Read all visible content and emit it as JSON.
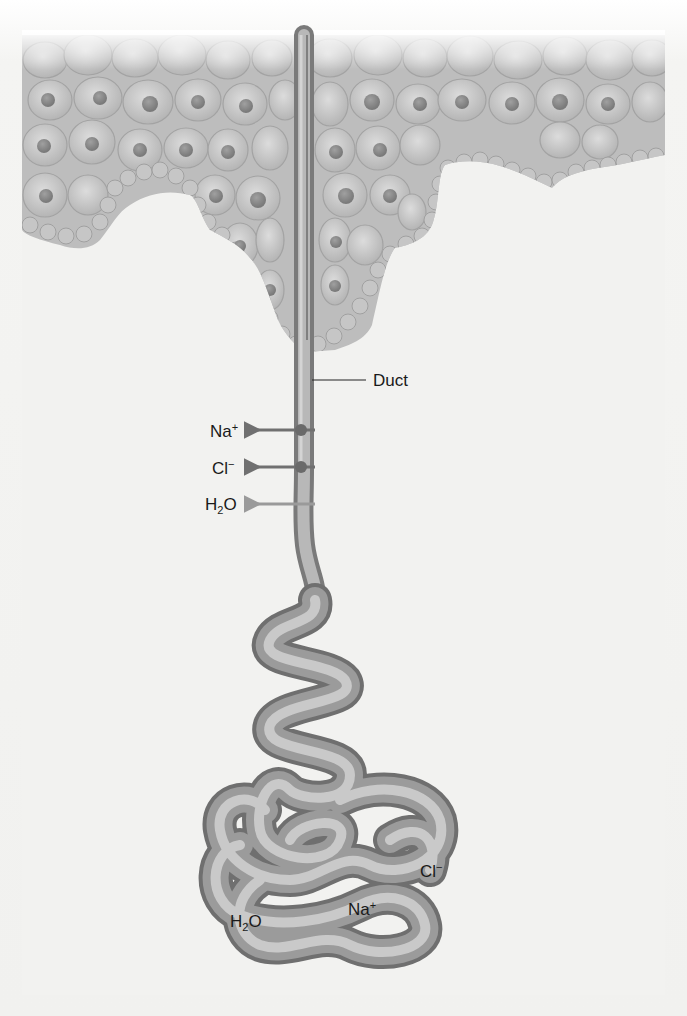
{
  "figure": {
    "background": "#f6f6f4",
    "epidermis_color": "#c9c9c9",
    "tube_color": "#9a9a9a",
    "arrow_color": "#7a7a7a"
  },
  "labels": {
    "duct": "Duct",
    "duct_side": [
      {
        "base": "Na",
        "sup": "+",
        "sub": ""
      },
      {
        "base": "Cl",
        "sup": "−",
        "sub": ""
      },
      {
        "base": "H",
        "sub": "2",
        "tail": "O",
        "sup": ""
      }
    ],
    "coil": {
      "cl": {
        "base": "Cl",
        "sup": "−"
      },
      "na": {
        "base": "Na",
        "sup": "+"
      },
      "h2o": {
        "base": "H",
        "sub": "2",
        "tail": "O"
      }
    }
  }
}
